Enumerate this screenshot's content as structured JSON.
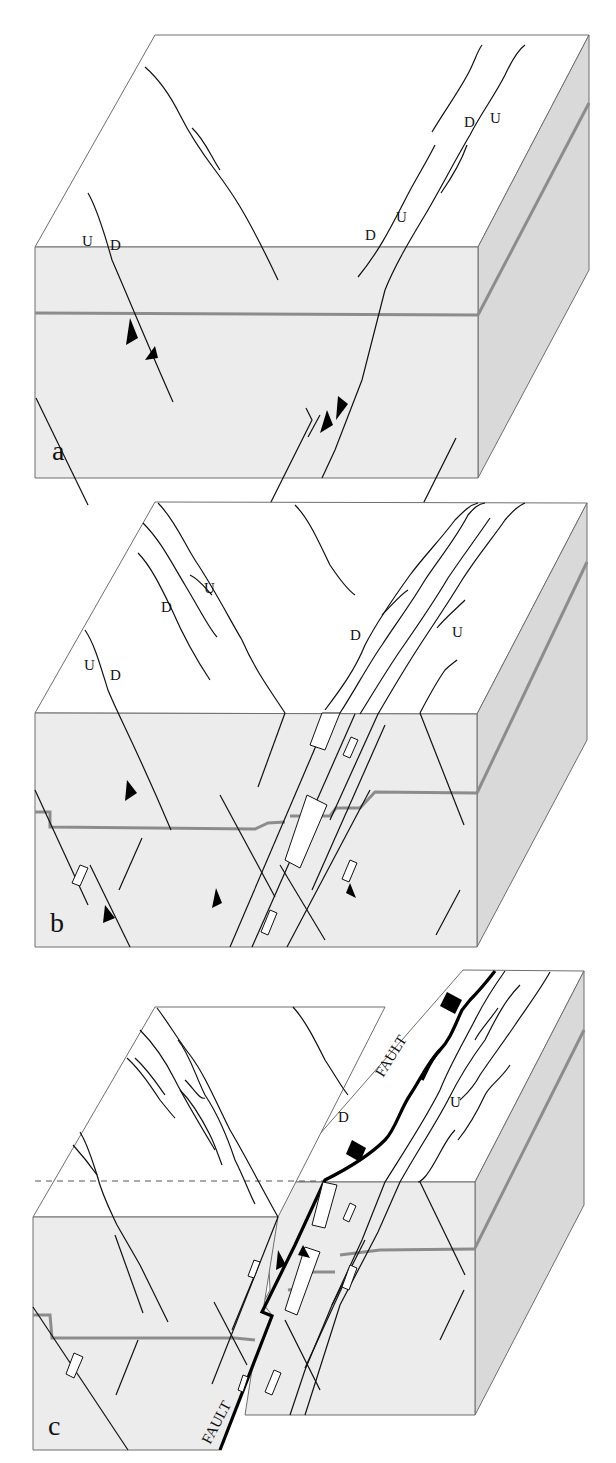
{
  "figure": {
    "panels": [
      {
        "id": "a",
        "label": "a",
        "sense_labels": [
          {
            "text": "U",
            "pos": "left-fault-west"
          },
          {
            "text": "D",
            "pos": "left-fault-east"
          },
          {
            "text": "D",
            "pos": "right-zone-lower-west"
          },
          {
            "text": "U",
            "pos": "right-zone-lower-east"
          },
          {
            "text": "D",
            "pos": "right-zone-upper-west"
          },
          {
            "text": "U",
            "pos": "right-zone-upper-east"
          }
        ]
      },
      {
        "id": "b",
        "label": "b",
        "sense_labels": [
          {
            "text": "U",
            "pos": "upper-left-zone-east"
          },
          {
            "text": "D",
            "pos": "upper-left-zone-west"
          },
          {
            "text": "U",
            "pos": "left-fault-west"
          },
          {
            "text": "D",
            "pos": "left-fault-east"
          },
          {
            "text": "D",
            "pos": "main-zone-west"
          },
          {
            "text": "U",
            "pos": "main-zone-east"
          }
        ]
      },
      {
        "id": "c",
        "label": "c",
        "sense_labels": [
          {
            "text": "D",
            "pos": "main-fault-west"
          },
          {
            "text": "U",
            "pos": "main-fault-east"
          }
        ],
        "fault_labels": [
          "FAULT",
          "FAULT"
        ]
      }
    ],
    "colors": {
      "top_face": "#ffffff",
      "front_face": "#ececec",
      "side_face": "#d9d9d9",
      "marker_band": "#8c8c8c",
      "line": "#111111"
    }
  }
}
